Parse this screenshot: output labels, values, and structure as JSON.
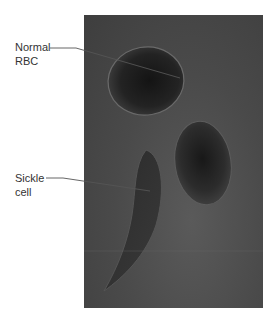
{
  "figure": {
    "type": "micrograph",
    "labels": [
      {
        "id": "normal",
        "line1": "Normal",
        "line2": "RBC"
      },
      {
        "id": "sickle",
        "line1": "Sickle",
        "line2": "cell"
      }
    ]
  }
}
